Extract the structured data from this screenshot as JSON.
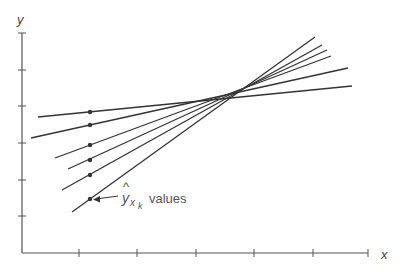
{
  "diagram": {
    "axes": {
      "x_label": "x",
      "y_label": "y",
      "origin": [
        22,
        253
      ],
      "x_end": 368,
      "y_end": 33,
      "x_ticks": [
        79,
        137,
        196,
        254,
        313,
        368
      ],
      "y_ticks": [
        33,
        70,
        106,
        143,
        180,
        216
      ],
      "color": "#555555"
    },
    "lines": [
      {
        "start": [
          38,
          117
        ],
        "end": [
          352,
          86
        ],
        "dot": [
          90,
          112
        ]
      },
      {
        "start": [
          31,
          138
        ],
        "end": [
          348,
          68
        ],
        "dot": [
          90,
          125
        ]
      },
      {
        "start": [
          55,
          158
        ],
        "end": [
          331,
          56
        ],
        "dot": [
          90,
          145
        ]
      },
      {
        "start": [
          68,
          169
        ],
        "end": [
          327,
          50
        ],
        "dot": [
          90,
          160
        ]
      },
      {
        "start": [
          62,
          190
        ],
        "end": [
          322,
          45
        ],
        "dot": [
          90,
          175
        ]
      },
      {
        "start": [
          72,
          212
        ],
        "end": [
          315,
          37
        ],
        "dot": [
          90,
          199
        ]
      }
    ],
    "line_color": "#333333",
    "annotation": {
      "symbol": "y",
      "hat": "^",
      "subscript": "x",
      "sub_subscript": "k",
      "text": "values",
      "arrow_from": [
        118,
        196
      ],
      "arrow_to": [
        93,
        199
      ]
    }
  }
}
